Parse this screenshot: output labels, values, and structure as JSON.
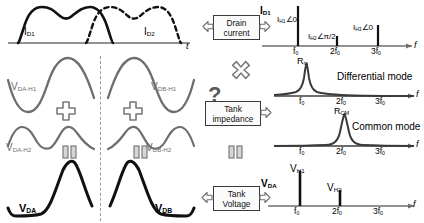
{
  "figure": {
    "colors": {
      "solid_black": "#111111",
      "gray_wave": "#6e6e6e",
      "axis": "#6e6e6e",
      "box_border": "#3a3a3a",
      "divider": "#9a9a9a"
    }
  },
  "left_column": {
    "drain_current_plot": {
      "axis_label": "t",
      "curves": [
        {
          "name": "ID1",
          "label_base": "I",
          "label_sub": "D1",
          "style": "solid"
        },
        {
          "name": "ID2",
          "label_base": "I",
          "label_sub": "D2",
          "style": "dashed"
        }
      ]
    },
    "harmonic_rows": [
      {
        "row": "h1",
        "left": {
          "label_base": "V",
          "label_sub": "DA-H1"
        },
        "right": {
          "label_base": "V",
          "label_sub": "DB-H1"
        },
        "operator": "+"
      },
      {
        "row": "h2",
        "left": {
          "label_base": "V",
          "label_sub": "DA-H2"
        },
        "right": {
          "label_base": "V",
          "label_sub": "DB-H2"
        },
        "operator": "="
      },
      {
        "row": "sum",
        "left": {
          "label_base": "V",
          "label_sub": "DA"
        },
        "right": {
          "label_base": "V",
          "label_sub": "DB"
        },
        "operator": ""
      }
    ]
  },
  "middle_column": {
    "drain_current_box": {
      "line1": "Drain",
      "line2": "current",
      "output_label_base": "I",
      "output_label_sub": "D1"
    },
    "multiply_symbol": "×",
    "question_mark": "?",
    "tank_impedance_box": {
      "line1": "Tank",
      "line2": "impedance"
    },
    "equals_symbol": "=",
    "tank_voltage_box": {
      "line1": "Tank",
      "line2": "Voltage",
      "output_label_base": "V",
      "output_label_sub": "DA"
    }
  },
  "right_column": {
    "current_spectrum": {
      "axis_label": "f",
      "ticks": [
        {
          "label_base": "f",
          "label_sub": "0",
          "x_frac": 0.235
        },
        {
          "label_base": "2f",
          "label_sub": "0",
          "x_frac": 0.5
        },
        {
          "label_base": "3f",
          "label_sub": "0",
          "x_frac": 0.775
        }
      ],
      "lines": [
        {
          "label": "IH1",
          "label_base": "I",
          "label_sub": "H1",
          "angle": "∠0",
          "x_frac": 0.235,
          "height_frac": 1.0
        },
        {
          "label": "IH2",
          "label_base": "I",
          "label_sub": "H2",
          "angle": "∠π/2",
          "x_frac": 0.5,
          "height_frac": 0.24
        },
        {
          "label": "IH3",
          "label_base": "I",
          "label_sub": "H3",
          "angle": "∠0",
          "x_frac": 0.775,
          "height_frac": 0.52
        }
      ]
    },
    "differential_mode": {
      "title": "Differential mode",
      "peak_label_base": "R",
      "peak_label_sub": "in",
      "axis_label": "f",
      "peak_at": "f0",
      "ticks": [
        {
          "label_base": "f",
          "label_sub": "0",
          "x_frac": 0.235
        },
        {
          "label_base": "2f",
          "label_sub": "0",
          "x_frac": 0.5
        },
        {
          "label_base": "3f",
          "label_sub": "0",
          "x_frac": 0.775
        }
      ]
    },
    "common_mode": {
      "title": "Common mode",
      "peak_label_base": "R",
      "peak_label_sub": "CM",
      "axis_label": "f",
      "peak_at": "2f0",
      "ticks": [
        {
          "label_base": "f",
          "label_sub": "0",
          "x_frac": 0.235
        },
        {
          "label_base": "2f",
          "label_sub": "0",
          "x_frac": 0.5
        },
        {
          "label_base": "3f",
          "label_sub": "0",
          "x_frac": 0.775
        }
      ]
    },
    "voltage_spectrum": {
      "axis_label": "f",
      "ticks": [
        {
          "label_base": "f",
          "label_sub": "0",
          "x_frac": 0.235
        },
        {
          "label_base": "2f",
          "label_sub": "0",
          "x_frac": 0.5
        },
        {
          "label_base": "3f",
          "label_sub": "0",
          "x_frac": 0.775
        }
      ],
      "lines": [
        {
          "label_base": "V",
          "label_sub": "H1",
          "x_frac": 0.235,
          "height_frac": 1.0
        },
        {
          "label_base": "V",
          "label_sub": "H2",
          "x_frac": 0.5,
          "height_frac": 0.46
        }
      ]
    }
  }
}
